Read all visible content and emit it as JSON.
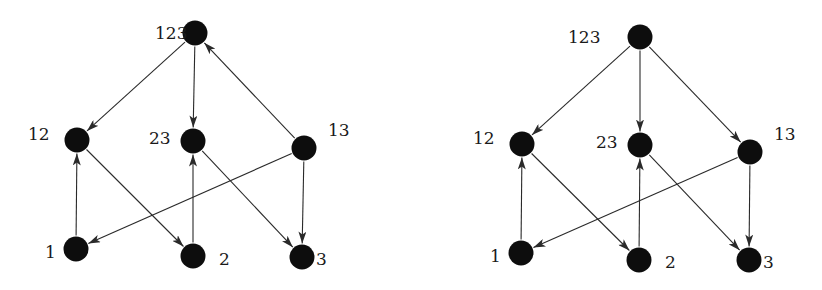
{
  "diagrams": [
    {
      "id": "left",
      "nodes": [
        {
          "id": "123",
          "label": "123",
          "x": 195,
          "y": 33,
          "lx": 155,
          "ly": 39
        },
        {
          "id": "12",
          "label": "12",
          "x": 77,
          "y": 140,
          "lx": 28,
          "ly": 140
        },
        {
          "id": "23",
          "label": "23",
          "x": 193,
          "y": 141,
          "lx": 149,
          "ly": 144
        },
        {
          "id": "13",
          "label": "13",
          "x": 304,
          "y": 148,
          "lx": 328,
          "ly": 136
        },
        {
          "id": "1",
          "label": "1",
          "x": 76,
          "y": 249,
          "lx": 45,
          "ly": 258
        },
        {
          "id": "2",
          "label": "2",
          "x": 193,
          "y": 256,
          "lx": 219,
          "ly": 265
        },
        {
          "id": "3",
          "label": "3",
          "x": 302,
          "y": 257,
          "lx": 316,
          "ly": 265
        }
      ],
      "edges": [
        {
          "from": "123",
          "to": "12"
        },
        {
          "from": "123",
          "to": "23"
        },
        {
          "from": "13",
          "to": "123"
        },
        {
          "from": "1",
          "to": "12"
        },
        {
          "from": "12",
          "to": "2"
        },
        {
          "from": "2",
          "to": "23"
        },
        {
          "from": "23",
          "to": "3"
        },
        {
          "from": "13",
          "to": "1"
        },
        {
          "from": "13",
          "to": "3"
        }
      ]
    },
    {
      "id": "right",
      "nodes": [
        {
          "id": "123",
          "label": "123",
          "x": 640,
          "y": 37,
          "lx": 568,
          "ly": 43
        },
        {
          "id": "12",
          "label": "12",
          "x": 522,
          "y": 144,
          "lx": 473,
          "ly": 144
        },
        {
          "id": "23",
          "label": "23",
          "x": 640,
          "y": 145,
          "lx": 596,
          "ly": 148
        },
        {
          "id": "13",
          "label": "13",
          "x": 750,
          "y": 152,
          "lx": 774,
          "ly": 140
        },
        {
          "id": "1",
          "label": "1",
          "x": 521,
          "y": 253,
          "lx": 490,
          "ly": 262
        },
        {
          "id": "2",
          "label": "2",
          "x": 639,
          "y": 260,
          "lx": 665,
          "ly": 268
        },
        {
          "id": "3",
          "label": "3",
          "x": 749,
          "y": 260,
          "lx": 763,
          "ly": 268
        }
      ],
      "edges": [
        {
          "from": "123",
          "to": "12"
        },
        {
          "from": "123",
          "to": "23"
        },
        {
          "from": "123",
          "to": "13"
        },
        {
          "from": "1",
          "to": "12"
        },
        {
          "from": "12",
          "to": "2"
        },
        {
          "from": "2",
          "to": "23"
        },
        {
          "from": "23",
          "to": "3"
        },
        {
          "from": "13",
          "to": "1"
        },
        {
          "from": "13",
          "to": "3"
        }
      ]
    }
  ],
  "style": {
    "node_radius": 12.5,
    "node_color": "#0d0d0d",
    "edge_color": "#2a2a2a"
  }
}
